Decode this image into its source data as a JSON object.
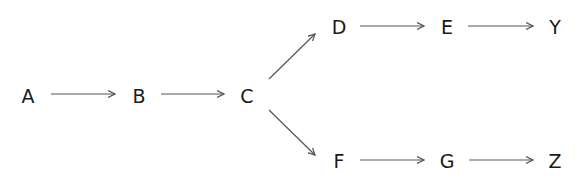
{
  "diagram": {
    "type": "flow",
    "colors": {
      "text": "#1a1a1a",
      "edge": "#555555",
      "background": "#ffffff"
    },
    "nodes": [
      {
        "id": "A",
        "label": "A",
        "x": 28,
        "y": 96
      },
      {
        "id": "B",
        "label": "B",
        "x": 139,
        "y": 96
      },
      {
        "id": "C",
        "label": "C",
        "x": 247,
        "y": 96
      },
      {
        "id": "D",
        "label": "D",
        "x": 339,
        "y": 27
      },
      {
        "id": "E",
        "label": "E",
        "x": 447,
        "y": 27
      },
      {
        "id": "Y",
        "label": "Y",
        "x": 555,
        "y": 27
      },
      {
        "id": "F",
        "label": "F",
        "x": 339,
        "y": 161
      },
      {
        "id": "G",
        "label": "G",
        "x": 447,
        "y": 161
      },
      {
        "id": "Z",
        "label": "Z",
        "x": 555,
        "y": 161
      }
    ],
    "edges": [
      {
        "from": "A",
        "to": "B",
        "x1": 51,
        "y1": 94,
        "x2": 115,
        "y2": 94
      },
      {
        "from": "B",
        "to": "C",
        "x1": 161,
        "y1": 94,
        "x2": 224,
        "y2": 94
      },
      {
        "from": "C",
        "to": "D",
        "x1": 269,
        "y1": 79,
        "x2": 315,
        "y2": 34
      },
      {
        "from": "C",
        "to": "F",
        "x1": 269,
        "y1": 110,
        "x2": 315,
        "y2": 155
      },
      {
        "from": "D",
        "to": "E",
        "x1": 360,
        "y1": 26,
        "x2": 424,
        "y2": 26
      },
      {
        "from": "E",
        "to": "Y",
        "x1": 468,
        "y1": 26,
        "x2": 533,
        "y2": 26
      },
      {
        "from": "F",
        "to": "G",
        "x1": 360,
        "y1": 160,
        "x2": 424,
        "y2": 160
      },
      {
        "from": "G",
        "to": "Z",
        "x1": 469,
        "y1": 160,
        "x2": 533,
        "y2": 160
      }
    ]
  }
}
